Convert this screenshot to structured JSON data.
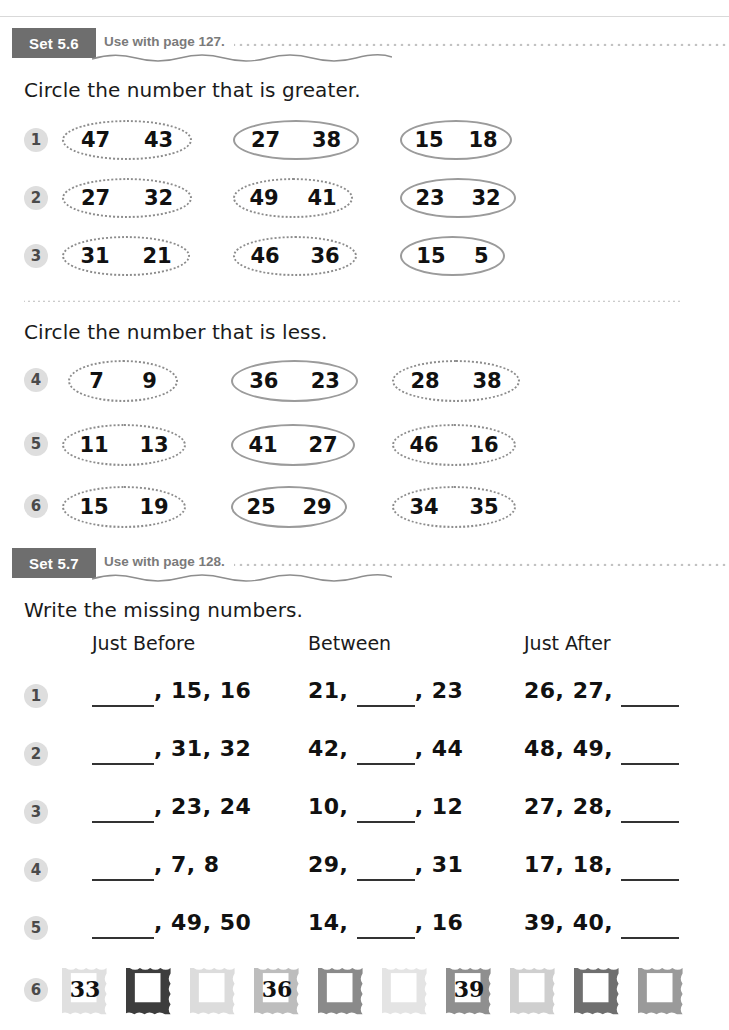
{
  "page": {
    "width": 729,
    "height": 1030
  },
  "sets": [
    {
      "badge": "Set 5.6",
      "use_with": "Use with page 127.",
      "instructions": [
        "Circle the number that is greater.",
        "Circle the number that is less."
      ],
      "groups": [
        {
          "instruction_index": 0,
          "rows": [
            {
              "number": "1",
              "pairs": [
                [
                  "47",
                  "43"
                ],
                [
                  "27",
                  "38"
                ],
                [
                  "15",
                  "18"
                ]
              ]
            },
            {
              "number": "2",
              "pairs": [
                [
                  "27",
                  "32"
                ],
                [
                  "49",
                  "41"
                ],
                [
                  "23",
                  "32"
                ]
              ]
            },
            {
              "number": "3",
              "pairs": [
                [
                  "31",
                  "21"
                ],
                [
                  "46",
                  "36"
                ],
                [
                  "15",
                  "5"
                ]
              ]
            }
          ]
        },
        {
          "instruction_index": 1,
          "rows": [
            {
              "number": "4",
              "pairs": [
                [
                  "7",
                  "9"
                ],
                [
                  "36",
                  "23"
                ],
                [
                  "28",
                  "38"
                ]
              ]
            },
            {
              "number": "5",
              "pairs": [
                [
                  "11",
                  "13"
                ],
                [
                  "41",
                  "27"
                ],
                [
                  "46",
                  "16"
                ]
              ]
            },
            {
              "number": "6",
              "pairs": [
                [
                  "15",
                  "19"
                ],
                [
                  "25",
                  "29"
                ],
                [
                  "34",
                  "35"
                ]
              ]
            }
          ]
        }
      ]
    },
    {
      "badge": "Set 5.7",
      "use_with": "Use with page 128.",
      "instruction": "Write the missing numbers.",
      "column_headers": [
        "Just Before",
        "Between",
        "Just After"
      ],
      "rows": [
        {
          "number": "1",
          "just_before": {
            "prefix": "",
            "blank": true,
            "suffix": ", 15, 16"
          },
          "between": {
            "prefix": "21, ",
            "blank": true,
            "suffix": ", 23"
          },
          "just_after": {
            "prefix": "26, 27, ",
            "blank": true,
            "suffix": ""
          }
        },
        {
          "number": "2",
          "just_before": {
            "prefix": "",
            "blank": true,
            "suffix": ", 31, 32"
          },
          "between": {
            "prefix": "42, ",
            "blank": true,
            "suffix": ", 44"
          },
          "just_after": {
            "prefix": "48, 49, ",
            "blank": true,
            "suffix": ""
          }
        },
        {
          "number": "3",
          "just_before": {
            "prefix": "",
            "blank": true,
            "suffix": ", 23, 24"
          },
          "between": {
            "prefix": "10, ",
            "blank": true,
            "suffix": ", 12"
          },
          "just_after": {
            "prefix": "27, 28, ",
            "blank": true,
            "suffix": ""
          }
        },
        {
          "number": "4",
          "just_before": {
            "prefix": "",
            "blank": true,
            "suffix": ", 7, 8"
          },
          "between": {
            "prefix": "29, ",
            "blank": true,
            "suffix": ", 31"
          },
          "just_after": {
            "prefix": "17, 18, ",
            "blank": true,
            "suffix": ""
          }
        },
        {
          "number": "5",
          "just_before": {
            "prefix": "",
            "blank": true,
            "suffix": ", 49, 50"
          },
          "between": {
            "prefix": "14, ",
            "blank": true,
            "suffix": ", 16"
          },
          "just_after": {
            "prefix": "39, 40, ",
            "blank": true,
            "suffix": ""
          }
        }
      ],
      "stamp_row": {
        "number": "6",
        "stamps": [
          {
            "value": "33",
            "shade": "#e0e0e0"
          },
          {
            "value": "",
            "shade": "#3d3d3d"
          },
          {
            "value": "",
            "shade": "#dcdcdc"
          },
          {
            "value": "36",
            "shade": "#bdbdbd"
          },
          {
            "value": "",
            "shade": "#8a8a8a"
          },
          {
            "value": "",
            "shade": "#e4e4e4"
          },
          {
            "value": "39",
            "shade": "#8f8f8f"
          },
          {
            "value": "",
            "shade": "#cfcfcf"
          },
          {
            "value": "",
            "shade": "#6f6f6f"
          },
          {
            "value": "",
            "shade": "#9a9a9a"
          }
        ]
      }
    }
  ],
  "colors": {
    "badge_bg": "#6e6e6e",
    "badge_text": "#ffffff",
    "use_with_text": "#7a7a7a",
    "dots": "#bdbdbd",
    "oval_border": "#8c8c8c",
    "num_badge_bg": "#dedede",
    "body_text": "#1a1a1a"
  }
}
